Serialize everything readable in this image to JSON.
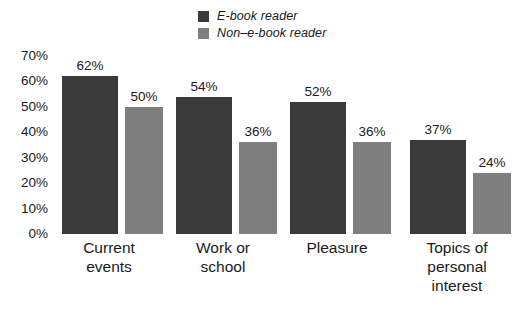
{
  "chart_data": {
    "type": "bar",
    "title": "",
    "subtitle": "",
    "xlabel": "",
    "ylabel": "",
    "ylim": [
      0,
      70
    ],
    "ytick_labels": [
      "70%",
      "60%",
      "50%",
      "40%",
      "30%",
      "20%",
      "10%",
      "0%"
    ],
    "ytick_values": [
      70,
      60,
      50,
      40,
      30,
      20,
      10,
      0
    ],
    "grid": false,
    "legend_position": "top-center",
    "value_labels_suffix": "%",
    "categories": [
      "Current\nevents",
      "Work or\nschool",
      "Pleasure",
      "Topics of\npersonal\ninterest"
    ],
    "series": [
      {
        "name": "E-book reader",
        "color": "#3a3a3a",
        "values": [
          62,
          54,
          52,
          37
        ],
        "value_labels": [
          "62%",
          "54%",
          "52%",
          "37%"
        ]
      },
      {
        "name": "Non–e-book reader",
        "color": "#7f7f7f",
        "values": [
          50,
          36,
          36,
          24
        ],
        "value_labels": [
          "50%",
          "36%",
          "36%",
          "24%"
        ]
      }
    ]
  },
  "legend": {
    "items": [
      {
        "label": "E-book reader",
        "color": "#3a3a3a"
      },
      {
        "label": "Non–e-book reader",
        "color": "#7f7f7f"
      }
    ]
  }
}
